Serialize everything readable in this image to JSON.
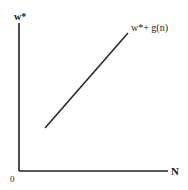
{
  "diagram": {
    "y_axis_label": "w*",
    "x_axis_label": "N",
    "origin_label": "0",
    "curve_label": "w*+ g(n)",
    "line_color": "#222222",
    "axes": {
      "origin": [
        19,
        171
      ],
      "y_top": 23,
      "x_right": 168
    },
    "curve": {
      "start": [
        45,
        128
      ],
      "end": [
        128,
        33
      ]
    }
  }
}
